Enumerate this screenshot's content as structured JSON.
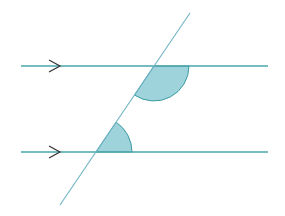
{
  "diagram": {
    "type": "geometry",
    "colors": {
      "line": "#4aa6a8",
      "transversal": "#6fb3c4",
      "shade_fill": "#9fd3dc",
      "shade_stroke": "#3a9ca0",
      "arrow": "#333333",
      "background": "#ffffff"
    },
    "parallel_lines": [
      {
        "name": "upper-parallel-line",
        "x1": 21,
        "y1": 66,
        "x2": 268,
        "y2": 66,
        "arrow_x": 55
      },
      {
        "name": "lower-parallel-line",
        "x1": 21,
        "y1": 152,
        "x2": 268,
        "y2": 152,
        "arrow_x": 55
      }
    ],
    "transversal": {
      "x1": 190,
      "y1": 13,
      "x2": 60,
      "y2": 205
    },
    "angles": [
      {
        "name": "upper-angle",
        "cx": 154,
        "cy": 66,
        "r": 35,
        "start_deg": 0,
        "end_deg": 124
      },
      {
        "name": "lower-angle",
        "cx": 96,
        "cy": 152,
        "r": 36,
        "start_deg": -56,
        "end_deg": 0
      }
    ]
  }
}
